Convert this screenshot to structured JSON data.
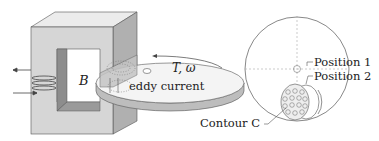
{
  "left_figure": {
    "field_label": "B",
    "torque_label": "T, ω",
    "eddy_label": "eddy current"
  },
  "right_figure": {
    "position1_label": "Position 1",
    "position2_label": "Position 2",
    "contour_label": "Contour C"
  },
  "colors": {
    "core_front": "#d6d6d6",
    "core_top": "#ececec",
    "core_side": "#a8a8a8",
    "inner_dark": "#8a8a8a",
    "disk_top": "#f4f4f4",
    "disk_edge": "#bdbdbd",
    "line": "#444444"
  }
}
